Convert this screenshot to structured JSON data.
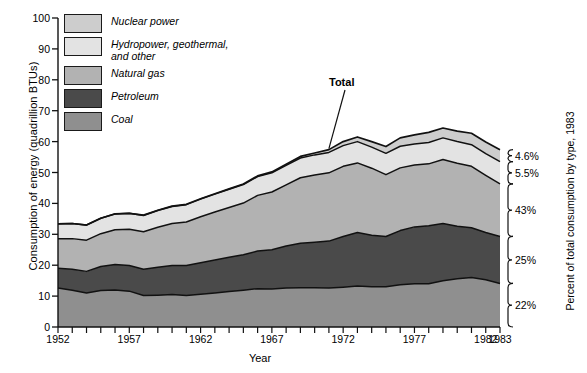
{
  "chart_data": {
    "type": "area",
    "title": "",
    "xlabel": "Year",
    "ylabel": "Consumption of energy (quadrillion BTUs)",
    "ylabel_right": "Percent of total consumption by type, 1983",
    "xlim": [
      1952,
      1983
    ],
    "ylim": [
      0,
      100
    ],
    "grid": false,
    "legend_position": "inside-top-left",
    "stacked": true,
    "ytick_labels": [
      "0",
      "10",
      "20",
      "30",
      "40",
      "50",
      "60",
      "70",
      "80",
      "90",
      "100"
    ],
    "ytick_values": [
      0,
      10,
      20,
      30,
      40,
      50,
      60,
      70,
      80,
      90,
      100
    ],
    "xtick_labels": [
      "1952",
      "1957",
      "1962",
      "1967",
      "1972",
      "1977",
      "1982",
      "1983"
    ],
    "xtick_values": [
      1952,
      1957,
      1962,
      1967,
      1972,
      1977,
      1982,
      1983
    ],
    "x": [
      1952,
      1953,
      1954,
      1955,
      1956,
      1957,
      1958,
      1959,
      1960,
      1961,
      1962,
      1963,
      1964,
      1965,
      1966,
      1967,
      1968,
      1969,
      1970,
      1971,
      1972,
      1973,
      1974,
      1975,
      1976,
      1977,
      1978,
      1979,
      1980,
      1981,
      1982,
      1983
    ],
    "series": [
      {
        "name": "Coal",
        "color": "#8f8f8f",
        "values": [
          12.6,
          11.9,
          11.0,
          11.8,
          12.0,
          11.6,
          10.2,
          10.3,
          10.5,
          10.2,
          10.6,
          11.0,
          11.5,
          11.9,
          12.4,
          12.3,
          12.6,
          12.7,
          12.7,
          12.6,
          12.9,
          13.3,
          13.0,
          13.0,
          13.7,
          14.0,
          14.0,
          15.0,
          15.6,
          16.0,
          15.3,
          14.1
        ],
        "percent_1983": "22%"
      },
      {
        "name": "Petroleum",
        "color": "#4a4a4a",
        "values": [
          6.4,
          6.8,
          7.0,
          7.8,
          8.2,
          8.3,
          8.5,
          9.0,
          9.4,
          9.7,
          10.2,
          10.7,
          11.1,
          11.5,
          12.2,
          12.7,
          13.6,
          14.4,
          14.7,
          15.2,
          16.4,
          17.3,
          16.7,
          16.3,
          17.5,
          18.4,
          18.8,
          18.5,
          17.0,
          16.1,
          15.3,
          15.2
        ],
        "percent_1983": "25%"
      },
      {
        "name": "Natural gas",
        "color": "#b2b2b2",
        "values": [
          9.6,
          9.9,
          10.1,
          10.6,
          11.3,
          11.7,
          12.1,
          13.0,
          13.6,
          14.1,
          14.9,
          15.5,
          16.1,
          16.7,
          18.0,
          18.7,
          19.8,
          21.2,
          21.8,
          22.1,
          22.7,
          22.5,
          21.7,
          20.0,
          20.3,
          20.0,
          20.0,
          20.7,
          20.4,
          19.9,
          18.5,
          17.0
        ],
        "percent_1983": "43%"
      },
      {
        "name": "Hydropower, geothermal,\nand other",
        "color": "#e3e3e3",
        "values": [
          4.8,
          4.9,
          4.9,
          5.0,
          5.1,
          5.2,
          5.3,
          5.4,
          5.5,
          5.6,
          5.7,
          5.8,
          5.9,
          6.0,
          6.1,
          6.2,
          6.3,
          6.4,
          6.5,
          6.6,
          6.7,
          6.9,
          6.8,
          6.9,
          7.0,
          6.8,
          6.9,
          7.0,
          7.0,
          7.0,
          7.0,
          7.2
        ],
        "percent_1983": "5.5%"
      },
      {
        "name": "Nuclear power",
        "color": "#cdcdcd",
        "values": [
          0.0,
          0.0,
          0.0,
          0.0,
          0.0,
          0.0,
          0.1,
          0.1,
          0.1,
          0.1,
          0.1,
          0.1,
          0.1,
          0.2,
          0.2,
          0.3,
          0.4,
          0.5,
          0.6,
          0.9,
          1.3,
          1.5,
          1.8,
          2.2,
          2.7,
          3.0,
          3.3,
          3.2,
          3.4,
          3.7,
          3.8,
          3.9
        ],
        "percent_1983": "4.6%"
      }
    ],
    "totals": [
      33.4,
      33.5,
      33.0,
      35.2,
      36.6,
      36.8,
      36.2,
      37.8,
      39.1,
      39.7,
      41.5,
      43.1,
      44.7,
      46.3,
      48.9,
      50.2,
      52.7,
      55.2,
      56.3,
      57.4,
      60.0,
      61.5,
      60.0,
      58.4,
      61.2,
      62.2,
      63.0,
      64.4,
      63.4,
      62.7,
      59.9,
      57.4
    ],
    "annotations": [
      {
        "text": "Total",
        "x": 1971,
        "note": "leader line pointing to top of stacked area"
      }
    ]
  },
  "legend": {
    "items": [
      {
        "label": "Nuclear power",
        "color": "#cdcdcd"
      },
      {
        "label": "Hydropower, geothermal,\nand other",
        "color": "#e3e3e3"
      },
      {
        "label": "Natural gas",
        "color": "#b2b2b2"
      },
      {
        "label": "Petroleum",
        "color": "#4a4a4a"
      },
      {
        "label": "Coal",
        "color": "#8f8f8f"
      }
    ]
  },
  "right_axis": {
    "title": "Percent of total consumption by type, 1983",
    "brackets": [
      {
        "label": "4.6%",
        "series": "Nuclear power"
      },
      {
        "label": "5.5%",
        "series": "Hydropower, geothermal, and other"
      },
      {
        "label": "43%",
        "series": "Natural gas"
      },
      {
        "label": "25%",
        "series": "Petroleum"
      },
      {
        "label": "22%",
        "series": "Coal"
      }
    ]
  }
}
